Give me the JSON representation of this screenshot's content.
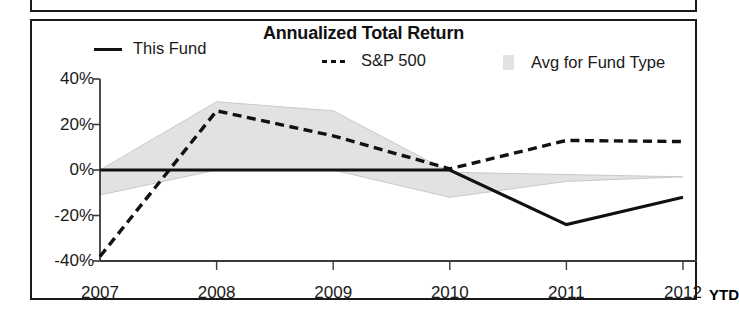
{
  "panel": {
    "title": "Annualized Total Return"
  },
  "legend": [
    {
      "key": "this_fund",
      "label": "This Fund",
      "style": "solid-line",
      "color": "#111111"
    },
    {
      "key": "sp500",
      "label": "S&P 500",
      "style": "dashed-line",
      "color": "#111111"
    },
    {
      "key": "avg_fund_type",
      "label": "Avg for Fund Type",
      "style": "shaded-band",
      "color": "#e2e2e2"
    }
  ],
  "axis": {
    "y_ticks": [
      "40%",
      "20%",
      "0%",
      "-20%",
      "-40%"
    ],
    "x_ticks": [
      "2007",
      "2008",
      "2009",
      "2010",
      "2011",
      "2012"
    ],
    "x_suffix": "YTD"
  },
  "chart_data": {
    "type": "line",
    "title": "Annualized Total Return",
    "xlabel": "",
    "ylabel": "",
    "ylim": [
      -40,
      40
    ],
    "ytick_values": [
      40,
      20,
      0,
      -20,
      -40
    ],
    "grid": false,
    "legend_position": "top",
    "categories": [
      "2007",
      "2008",
      "2009",
      "2010",
      "2011",
      "2012"
    ],
    "series": [
      {
        "name": "This Fund",
        "style": "solid-line",
        "color": "#111111",
        "values": [
          0,
          0,
          0,
          0,
          -24,
          -12
        ]
      },
      {
        "name": "S&P 500",
        "style": "dashed-line",
        "color": "#111111",
        "values": [
          -38,
          26,
          15,
          0.5,
          13,
          12.5
        ]
      },
      {
        "name": "Avg for Fund Type",
        "style": "shaded-band",
        "color": "#e2e2e2",
        "band_upper": [
          0,
          30,
          26,
          -1,
          -2,
          -3
        ],
        "band_lower": [
          -11,
          0,
          0,
          -12,
          -5,
          -3
        ]
      }
    ],
    "annotations": [
      "YTD marker after 2012 on x-axis"
    ]
  }
}
